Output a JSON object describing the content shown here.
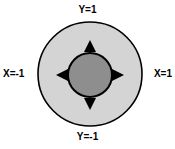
{
  "diagram": {
    "title": "",
    "background_color": "#ffffff",
    "width": 175,
    "height": 149,
    "outer_circle": {
      "name": "outer-circle",
      "center_x": 90,
      "center_y": 74,
      "radius": 52,
      "fill_color": "#d4d4d4",
      "stroke_color": "#000000",
      "stroke_width": 1.6
    },
    "inner_circle": {
      "name": "inner-circle",
      "center_x": 90,
      "center_y": 75,
      "radius": 22,
      "fill_color": "#8e8e8e",
      "stroke_color": "#000000",
      "stroke_width": 2
    },
    "arrows": [
      {
        "name": "arrow-up",
        "direction": "up",
        "from_x": 90,
        "from_y": 53,
        "to_x": 90,
        "to_y": 38,
        "color": "#000000"
      },
      {
        "name": "arrow-down",
        "direction": "down",
        "from_x": 90,
        "from_y": 97,
        "to_x": 90,
        "to_y": 112,
        "color": "#000000"
      },
      {
        "name": "arrow-left",
        "direction": "left",
        "from_x": 68,
        "from_y": 75,
        "to_x": 54,
        "to_y": 75,
        "color": "#000000"
      },
      {
        "name": "arrow-right",
        "direction": "right",
        "from_x": 112,
        "from_y": 75,
        "to_x": 126,
        "to_y": 75,
        "color": "#000000"
      }
    ],
    "labels": {
      "top": "Y=1",
      "bottom": "Y=-1",
      "left": "X=-1",
      "right": "X=1"
    }
  },
  "chart_data": {
    "type": "diagram",
    "title": "",
    "annotations": [
      {
        "text": "Y=1",
        "position": "top"
      },
      {
        "text": "Y=-1",
        "position": "bottom"
      },
      {
        "text": "X=-1",
        "position": "left"
      },
      {
        "text": "X=1",
        "position": "right"
      }
    ]
  }
}
